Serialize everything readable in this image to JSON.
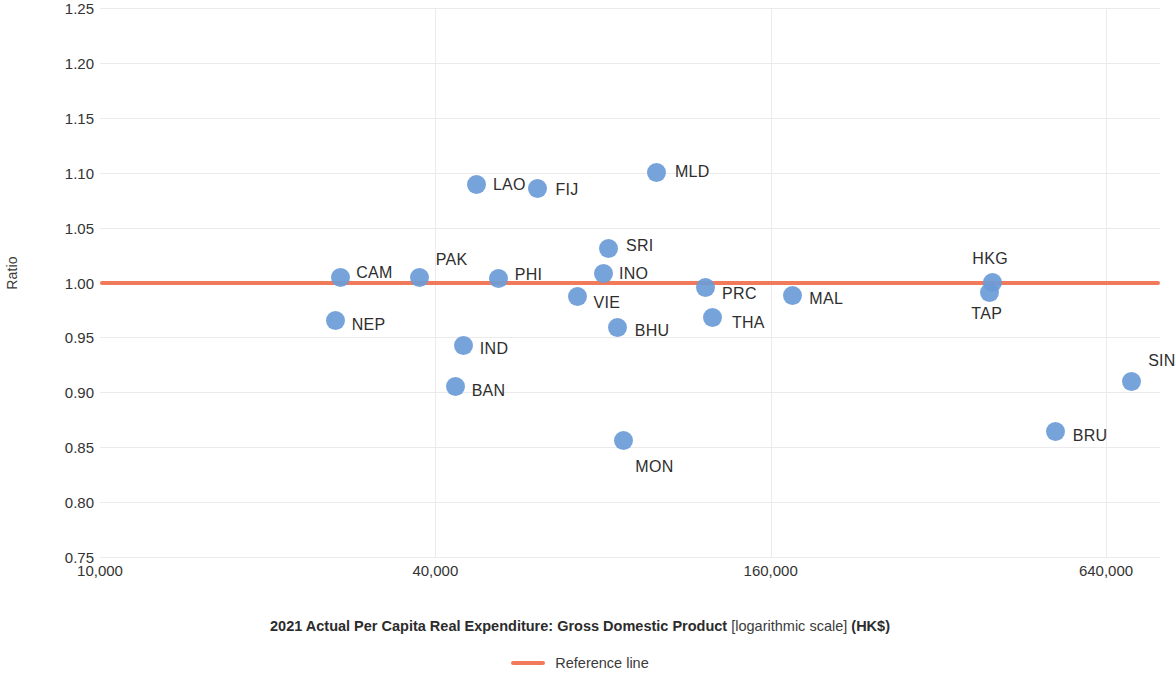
{
  "chart_data": {
    "type": "scatter",
    "title": "",
    "xlabel": "2021 Actual Per Capita Real Expenditure: Gross Domestic Product [logarithmic scale] (HK$)",
    "ylabel": "Ratio",
    "xscale": "logarithmic",
    "xlim": [
      10000,
      800000
    ],
    "ylim": [
      0.75,
      1.25
    ],
    "grid": true,
    "x_ticks": [
      "10,000",
      "40,000",
      "160,000",
      "640,000"
    ],
    "x_tick_values": [
      10000,
      40000,
      160000,
      640000
    ],
    "y_ticks": [
      "1.25",
      "1.20",
      "1.15",
      "1.10",
      "1.05",
      "1.00",
      "0.95",
      "0.90",
      "0.85",
      "0.80",
      "0.75"
    ],
    "y_tick_values": [
      1.25,
      1.2,
      1.15,
      1.1,
      1.05,
      1.0,
      0.95,
      0.9,
      0.85,
      0.8,
      0.75
    ],
    "point_color": "#6b9bd8",
    "reference_line": {
      "label": "Reference line",
      "color": "#f07a5a",
      "value": 1.0
    },
    "legend": {
      "position": "bottom",
      "entries": [
        {
          "label": "Reference line",
          "color": "#f07a5a",
          "marker": "line"
        }
      ]
    },
    "points": [
      {
        "label": "NEP",
        "x": 26500,
        "y": 0.965,
        "label_dx": 16,
        "label_dy": 4
      },
      {
        "label": "CAM",
        "x": 27000,
        "y": 1.005,
        "label_dx": 16,
        "label_dy": -4
      },
      {
        "label": "PAK",
        "x": 37500,
        "y": 1.005,
        "label_dx": 16,
        "label_dy": -17
      },
      {
        "label": "BAN",
        "x": 43500,
        "y": 0.905,
        "label_dx": 16,
        "label_dy": 4
      },
      {
        "label": "IND",
        "x": 45000,
        "y": 0.943,
        "label_dx": 16,
        "label_dy": 4
      },
      {
        "label": "LAO",
        "x": 47500,
        "y": 1.089,
        "label_dx": 16,
        "label_dy": 0
      },
      {
        "label": "PHI",
        "x": 52000,
        "y": 1.004,
        "label_dx": 16,
        "label_dy": -3
      },
      {
        "label": "FIJ",
        "x": 61000,
        "y": 1.086,
        "label_dx": 18,
        "label_dy": 2
      },
      {
        "label": "VIE",
        "x": 72000,
        "y": 0.987,
        "label_dx": 16,
        "label_dy": 6
      },
      {
        "label": "INO",
        "x": 80000,
        "y": 1.008,
        "label_dx": 16,
        "label_dy": 0
      },
      {
        "label": "SRI",
        "x": 82000,
        "y": 1.031,
        "label_dx": 17,
        "label_dy": -2
      },
      {
        "label": "BHU",
        "x": 85000,
        "y": 0.959,
        "label_dx": 17,
        "label_dy": 3
      },
      {
        "label": "MON",
        "x": 87000,
        "y": 0.856,
        "label_dx": 12,
        "label_dy": 26
      },
      {
        "label": "MLD",
        "x": 100000,
        "y": 1.1,
        "label_dx": 18,
        "label_dy": -1
      },
      {
        "label": "PRC",
        "x": 122000,
        "y": 0.995,
        "label_dx": 17,
        "label_dy": 6
      },
      {
        "label": "THA",
        "x": 126000,
        "y": 0.968,
        "label_dx": 19,
        "label_dy": 5
      },
      {
        "label": "MAL",
        "x": 175000,
        "y": 0.988,
        "label_dx": 17,
        "label_dy": 3
      },
      {
        "label": "HKG",
        "x": 400000,
        "y": 1.0,
        "label_dx": 0,
        "label_dy": -24
      },
      {
        "label": "TAP",
        "x": 395000,
        "y": 0.991,
        "label_dx": -18,
        "label_dy": 22
      },
      {
        "label": "BRU",
        "x": 520000,
        "y": 0.864,
        "label_dx": 17,
        "label_dy": 4
      },
      {
        "label": "SIN",
        "x": 710000,
        "y": 0.91,
        "label_dx": 17,
        "label_dy": -20
      }
    ]
  },
  "axes": {
    "y_title": "Ratio",
    "x_title_main": "2021 Actual Per Capita Real Expenditure: Gross Domestic Product",
    "x_title_bracket": " [logarithmic scale] ",
    "x_title_unit": "(HK$)"
  },
  "legend": {
    "reference_line_label": "Reference line"
  },
  "colors": {
    "point": "#6b9bd8",
    "reference_line": "#f07a5a",
    "grid": "#eceaea",
    "text": "#333333"
  }
}
